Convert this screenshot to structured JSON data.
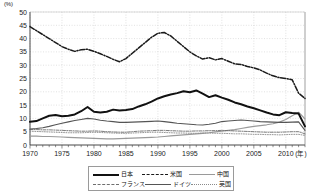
{
  "axis": {
    "y_unit": "(%)",
    "x_unit": "(年)",
    "y_ticks": [
      "0",
      "5",
      "10",
      "15",
      "20",
      "25",
      "30",
      "35",
      "40",
      "45",
      "50"
    ],
    "x_ticks": [
      "1970",
      "1975",
      "1980",
      "1985",
      "1990",
      "1995",
      "2000",
      "2005",
      "2010"
    ]
  },
  "legend": {
    "japan": "日本",
    "usa": "米国",
    "china": "中国",
    "france": "フランス",
    "germany": "ドイツ",
    "uk": "英国"
  },
  "colors": {
    "japan": "#111111",
    "usa": "#1a1a1a",
    "china": "#9a9a9a",
    "france": "#6e6e6e",
    "germany": "#555555",
    "uk": "#8a8a8a",
    "grid": "#cccccc",
    "axis": "#555555",
    "border": "#9a9a9a"
  },
  "chart_data": {
    "type": "line",
    "title": "",
    "xlabel": "(年)",
    "ylabel": "(%)",
    "xlim": [
      1970,
      2013
    ],
    "ylim": [
      0,
      50
    ],
    "grid": true,
    "legend_position": "bottom",
    "x": [
      1970,
      1971,
      1972,
      1973,
      1974,
      1975,
      1976,
      1977,
      1978,
      1979,
      1980,
      1981,
      1982,
      1983,
      1984,
      1985,
      1986,
      1987,
      1988,
      1989,
      1990,
      1991,
      1992,
      1993,
      1994,
      1995,
      1996,
      1997,
      1998,
      1999,
      2000,
      2001,
      2002,
      2003,
      2004,
      2005,
      2006,
      2007,
      2008,
      2009,
      2010,
      2011,
      2012,
      2013
    ],
    "series": [
      {
        "name": "米国",
        "style": "dash-dot",
        "values": [
          44.5,
          43.0,
          41.5,
          40.0,
          38.5,
          37.0,
          36.0,
          35.2,
          35.8,
          36.0,
          35.2,
          34.3,
          33.3,
          32.2,
          31.3,
          32.5,
          34.5,
          36.5,
          38.5,
          40.5,
          42.0,
          42.3,
          41.0,
          39.0,
          37.0,
          35.0,
          33.5,
          32.3,
          32.8,
          32.0,
          32.5,
          31.5,
          30.5,
          30.3,
          29.5,
          29.0,
          28.2,
          27.0,
          26.0,
          25.3,
          25.0,
          24.5,
          19.5,
          17.5
        ]
      },
      {
        "name": "日本",
        "style": "solid-thick",
        "values": [
          8.7,
          9.0,
          10.0,
          11.0,
          11.3,
          10.8,
          11.0,
          11.5,
          12.7,
          14.3,
          12.5,
          12.2,
          12.5,
          13.3,
          13.0,
          13.2,
          13.5,
          14.5,
          15.3,
          16.3,
          17.5,
          18.3,
          19.0,
          19.5,
          20.2,
          19.8,
          20.5,
          19.3,
          18.0,
          18.7,
          17.8,
          17.0,
          16.0,
          15.3,
          14.5,
          13.8,
          13.0,
          12.2,
          11.5,
          11.2,
          12.3,
          12.0,
          11.8,
          7.0
        ]
      },
      {
        "name": "中国",
        "style": "solid-thin",
        "values": [
          3.3,
          3.3,
          3.2,
          3.2,
          3.1,
          3.0,
          2.9,
          2.8,
          2.7,
          2.6,
          2.5,
          2.4,
          2.3,
          2.3,
          2.4,
          2.5,
          2.6,
          2.7,
          2.8,
          2.9,
          3.0,
          3.2,
          3.4,
          3.6,
          3.8,
          4.0,
          4.2,
          4.4,
          4.6,
          4.9,
          5.2,
          5.5,
          5.8,
          6.2,
          6.6,
          7.0,
          7.3,
          7.6,
          8.0,
          8.6,
          9.6,
          11.0,
          12.3,
          9.8
        ]
      },
      {
        "name": "ドイツ",
        "style": "solid-mid",
        "values": [
          6.0,
          6.2,
          6.5,
          7.0,
          7.6,
          8.2,
          8.7,
          9.2,
          9.6,
          10.0,
          9.8,
          9.3,
          9.0,
          8.8,
          8.5,
          8.5,
          8.6,
          8.7,
          8.8,
          8.9,
          9.0,
          8.8,
          8.5,
          8.2,
          8.0,
          7.8,
          7.6,
          7.5,
          7.8,
          8.2,
          8.8,
          9.0,
          9.2,
          9.4,
          9.2,
          9.0,
          8.8,
          8.7,
          8.6,
          8.5,
          8.5,
          8.6,
          8.7,
          5.5
        ]
      },
      {
        "name": "フランス",
        "style": "dash-dot-thin",
        "values": [
          5.8,
          5.8,
          5.7,
          5.7,
          5.6,
          5.5,
          5.4,
          5.3,
          5.2,
          5.2,
          5.3,
          5.2,
          5.0,
          4.9,
          4.8,
          4.8,
          5.0,
          5.2,
          5.3,
          5.4,
          5.5,
          5.5,
          5.4,
          5.3,
          5.2,
          5.2,
          5.3,
          5.3,
          5.4,
          5.4,
          5.5,
          5.4,
          5.3,
          5.2,
          5.1,
          5.0,
          4.9,
          4.8,
          4.8,
          4.8,
          4.9,
          5.0,
          5.0,
          4.2
        ]
      },
      {
        "name": "英国",
        "style": "dotted",
        "values": [
          5.2,
          5.1,
          5.0,
          4.9,
          4.8,
          4.7,
          4.6,
          4.6,
          4.6,
          4.7,
          4.8,
          4.7,
          4.6,
          4.5,
          4.4,
          4.4,
          4.5,
          4.6,
          4.7,
          4.8,
          4.8,
          4.7,
          4.6,
          4.5,
          4.5,
          4.4,
          4.4,
          4.5,
          4.5,
          4.4,
          4.4,
          4.3,
          4.2,
          4.2,
          4.1,
          4.0,
          4.0,
          3.9,
          3.9,
          3.8,
          3.9,
          4.0,
          4.0,
          3.6
        ]
      }
    ]
  }
}
